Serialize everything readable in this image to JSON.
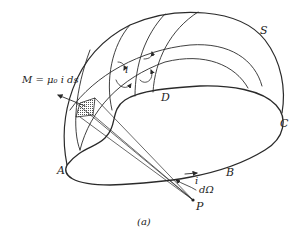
{
  "figure": {
    "caption": "(a)",
    "labels": {
      "surface": "S",
      "point_a": "A",
      "point_b": "B",
      "point_c": "C",
      "point_d": "D",
      "point_p": "P",
      "current_loop": "i",
      "current_cell": "i",
      "solid_angle": "dΩ",
      "moment": "M = μ₀ i ds"
    }
  }
}
